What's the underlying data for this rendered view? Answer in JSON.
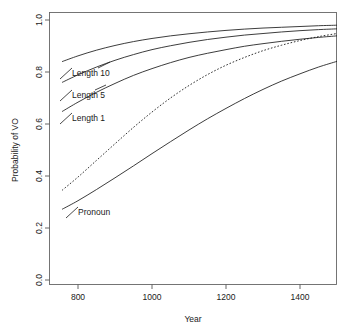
{
  "chart_data": {
    "type": "line",
    "title": "",
    "xlabel": "Year",
    "ylabel": "Probability of VO",
    "xlim": [
      757,
      1500
    ],
    "ylim": [
      0.0,
      1.0
    ],
    "grid": false,
    "legend": "inline-curve-labels",
    "xticks": [
      800,
      1000,
      1200,
      1400
    ],
    "xtick_labels": [
      "800",
      "1000",
      "1200",
      "1400"
    ],
    "yticks": [
      0.0,
      0.2,
      0.4,
      0.6,
      0.8,
      1.0
    ],
    "ytick_labels": [
      "0.0",
      "0.2",
      "0.4",
      "0.6",
      "0.8",
      "1.0"
    ],
    "x": [
      757,
      800,
      850,
      900,
      950,
      1000,
      1050,
      1100,
      1150,
      1200,
      1250,
      1300,
      1350,
      1400,
      1450,
      1500
    ],
    "series": [
      {
        "name": "Length 10",
        "label": "Length 10",
        "style": "solid",
        "color": "#1a1a1a",
        "values": [
          0.84,
          0.862,
          0.884,
          0.902,
          0.917,
          0.929,
          0.939,
          0.947,
          0.954,
          0.96,
          0.965,
          0.969,
          0.972,
          0.975,
          0.978,
          0.98
        ]
      },
      {
        "name": "Length 5",
        "label": "Length 5",
        "style": "solid",
        "color": "#1a1a1a",
        "values": [
          0.76,
          0.789,
          0.819,
          0.845,
          0.867,
          0.886,
          0.901,
          0.914,
          0.925,
          0.934,
          0.942,
          0.948,
          0.954,
          0.959,
          0.963,
          0.966
        ]
      },
      {
        "name": "Length 1",
        "label": "Length 1",
        "style": "solid",
        "color": "#1a1a1a",
        "values": [
          0.648,
          0.684,
          0.722,
          0.756,
          0.787,
          0.813,
          0.836,
          0.856,
          0.872,
          0.886,
          0.899,
          0.909,
          0.918,
          0.926,
          0.933,
          0.939
        ]
      },
      {
        "name": "Dotted trend",
        "label": "",
        "style": "dotted",
        "color": "#1a1a1a",
        "values": [
          0.345,
          0.396,
          0.46,
          0.524,
          0.587,
          0.646,
          0.7,
          0.748,
          0.79,
          0.826,
          0.856,
          0.882,
          0.903,
          0.921,
          0.936,
          0.948
        ]
      },
      {
        "name": "Pronoun",
        "label": "Pronoun",
        "style": "solid",
        "color": "#1a1a1a",
        "values": [
          0.272,
          0.305,
          0.348,
          0.393,
          0.439,
          0.486,
          0.532,
          0.577,
          0.62,
          0.66,
          0.698,
          0.733,
          0.765,
          0.793,
          0.819,
          0.841
        ]
      }
    ],
    "annotations": [
      {
        "name": "label-length-10",
        "text": "Length 10",
        "x_px": 62,
        "y_px": 73
      },
      {
        "name": "label-length-5",
        "text": "Length 5",
        "x_px": 62,
        "y_px": 95
      },
      {
        "name": "label-length-1",
        "text": "Length 1",
        "x_px": 62,
        "y_px": 118
      },
      {
        "name": "label-pronoun",
        "text": "Pronoun",
        "x_px": 68,
        "y_px": 212
      }
    ]
  }
}
